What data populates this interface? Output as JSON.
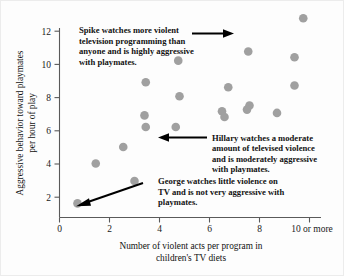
{
  "chart_data": {
    "type": "scatter",
    "title": "",
    "xlabel": "Number of violent acts per program in children's TV diets",
    "xlabel_line1": "Number of violent acts per program in",
    "xlabel_line2": "children's TV diets",
    "ylabel": "Aggressive behavior toward playmates per hour of play",
    "ylabel_line1": "Aggressive behavior toward playmates",
    "ylabel_line2": "per hour of play",
    "xlim": [
      0,
      10.6
    ],
    "ylim": [
      0,
      12.8
    ],
    "xticks": [
      0,
      2,
      4,
      6,
      8,
      10
    ],
    "xticklabels": [
      "0",
      "2",
      "4",
      "6",
      "8",
      "10 or more"
    ],
    "yticks": [
      2,
      4,
      6,
      8,
      10,
      12
    ],
    "yticklabels": [
      "2",
      "4",
      "6",
      "8",
      "10",
      "12"
    ],
    "grid": false,
    "legend": false,
    "marker_color": "#a0a0a0",
    "axis_color": "#5a5a5a",
    "points": [
      {
        "x": 0.72,
        "y": 0.85,
        "label": "George"
      },
      {
        "x": 1.45,
        "y": 3.25
      },
      {
        "x": 2.55,
        "y": 4.25
      },
      {
        "x": 3.0,
        "y": 2.2
      },
      {
        "x": 3.45,
        "y": 8.15
      },
      {
        "x": 3.4,
        "y": 6.15
      },
      {
        "x": 3.45,
        "y": 5.45
      },
      {
        "x": 4.65,
        "y": 5.45,
        "label": "Hillary"
      },
      {
        "x": 4.75,
        "y": 9.45
      },
      {
        "x": 4.8,
        "y": 7.3
      },
      {
        "x": 6.5,
        "y": 6.4
      },
      {
        "x": 6.6,
        "y": 6.05
      },
      {
        "x": 6.75,
        "y": 7.85
      },
      {
        "x": 7.55,
        "y": 10.0
      },
      {
        "x": 7.6,
        "y": 6.75
      },
      {
        "x": 7.5,
        "y": 6.5
      },
      {
        "x": 8.7,
        "y": 6.3
      },
      {
        "x": 9.4,
        "y": 9.65
      },
      {
        "x": 9.4,
        "y": 7.95
      },
      {
        "x": 9.75,
        "y": 12.0,
        "label": "Spike"
      }
    ]
  },
  "annotations": {
    "spike": {
      "name": "Spike",
      "lines": [
        "Spike watches more violent",
        "television programming than",
        "anyone and is highly aggressive",
        "with playmates."
      ],
      "arrow_direction": "right"
    },
    "hillary": {
      "name": "Hillary",
      "lines": [
        "Hillary watches a moderate",
        "amount of televised violence",
        "and is moderately aggressive",
        "with playmates."
      ],
      "arrow_direction": "left"
    },
    "george": {
      "name": "George",
      "lines": [
        "George watches little violence on",
        "TV and is not very aggressive with",
        "playmates."
      ],
      "arrow_direction": "down-left"
    }
  }
}
